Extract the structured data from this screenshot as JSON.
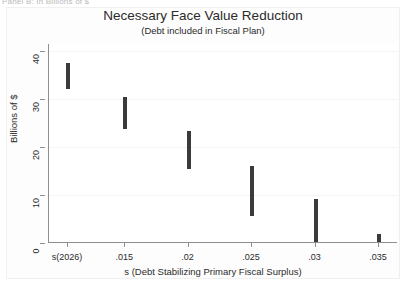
{
  "panel_caption": "Panel B: In Billions of $",
  "chart_data": {
    "type": "bar",
    "title": "Necessary Face Value Reduction",
    "subtitle": "(Debt included in Fiscal Plan)",
    "xlabel": "s (Debt Stabilizing Primary Fiscal Surplus)",
    "ylabel": "Billions of $",
    "grid": true,
    "legend": "none",
    "categories": [
      "s(2026)",
      ".015",
      ".02",
      ".025",
      ".03",
      ".035"
    ],
    "x": [
      0.0105,
      0.015,
      0.02,
      0.025,
      0.03,
      0.035
    ],
    "xlim": [
      0.009,
      0.0365
    ],
    "ylim": [
      0,
      41.5
    ],
    "yticks": [
      0,
      10,
      20,
      30,
      40
    ],
    "ytick_labels": [
      "0",
      "10",
      "20",
      "30",
      "40"
    ],
    "xtick_labels": [
      "s(2026)",
      ".015",
      ".02",
      ".025",
      ".03",
      ".035"
    ],
    "series": [
      {
        "name": "Necessary face value reduction range",
        "style": "vertical-range-bar",
        "color": "#3b3b3b",
        "ranges": [
          {
            "category": "s(2026)",
            "low": 32.2,
            "high": 37.6
          },
          {
            "category": ".015",
            "low": 23.8,
            "high": 30.5
          },
          {
            "category": ".02",
            "low": 15.5,
            "high": 23.4
          },
          {
            "category": ".025",
            "low": 5.6,
            "high": 16.1
          },
          {
            "category": ".03",
            "low": 0.2,
            "high": 9.2
          },
          {
            "category": ".035",
            "low": 0.2,
            "high": 1.9
          }
        ]
      }
    ]
  }
}
